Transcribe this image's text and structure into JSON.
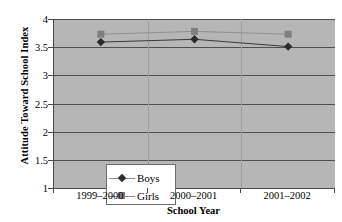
{
  "chart_data": {
    "type": "line",
    "title": "",
    "xlabel": "School Year",
    "ylabel": "Attitude Toward School Index",
    "categories": [
      "1999–2000",
      "2000–2001",
      "2001–2002"
    ],
    "ylim": [
      1,
      4
    ],
    "yticks": [
      1,
      1.5,
      2,
      2.5,
      3,
      3.5,
      4
    ],
    "ytick_labels": [
      "1",
      "1.5",
      "2",
      "2.5",
      "3",
      "3.5",
      "4"
    ],
    "grid": true,
    "legend_position": "lower-left-inside",
    "series": [
      {
        "name": "Boys",
        "marker": "diamond",
        "color": "#2b2b2b",
        "values": [
          3.59,
          3.64,
          3.51
        ]
      },
      {
        "name": "Girls",
        "marker": "square",
        "color": "#7f7f7f",
        "values": [
          3.73,
          3.78,
          3.73
        ]
      }
    ],
    "plot_background": "#b6b6b6",
    "gridline_color": "#4f4f4f",
    "axis_color": "#4a4a4a"
  },
  "legend": {
    "items": [
      {
        "label": "Boys"
      },
      {
        "label": "Girls"
      }
    ]
  }
}
